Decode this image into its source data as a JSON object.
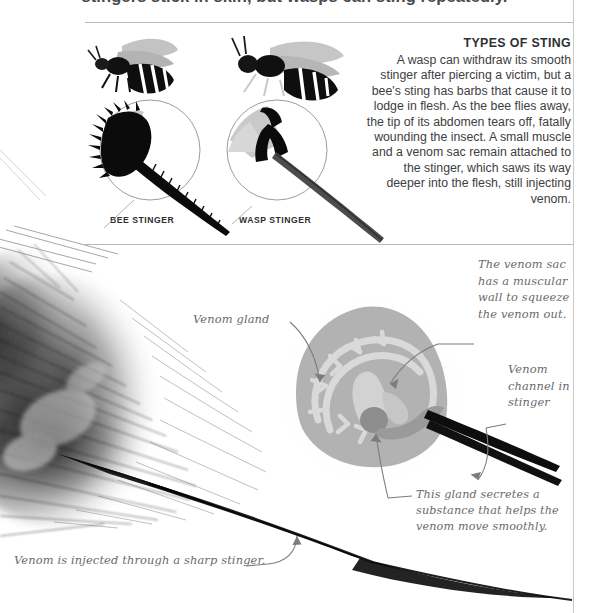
{
  "page": {
    "headline_clipped": "stingers stick in skin, but wasps can sting repeatedly.",
    "background": "#ffffff",
    "rule_color": "#b9b9ba"
  },
  "types_of_sting": {
    "title": "TYPES OF STING",
    "body": "A wasp can withdraw its smooth stinger after piercing a victim, but a bee's sting has barbs that cause it to lodge in flesh. As the bee flies away, the tip of its abdomen tears off, fatally wounding the insect. A small muscle and a venom sac remain attached to the stinger, which saws its way deeper into the flesh, still injecting venom."
  },
  "comparison": {
    "bee": {
      "caption": "BEE STINGER",
      "insect_icon": "honeybee-icon",
      "detail_icon": "barbed-stinger-icon"
    },
    "wasp": {
      "caption": "WASP STINGER",
      "insect_icon": "wasp-icon",
      "detail_icon": "smooth-stinger-icon"
    }
  },
  "anatomy": {
    "venom_gland_label": "Venom gland",
    "venom_sac_note": "The venom sac\nhas a muscular\nwall to squeeze\nthe venom out.",
    "venom_channel_label": "Venom\nchannel in\nstinger",
    "gland_secretion_note": "This gland secretes a\nsubstance that helps the\nvenom move smoothly.",
    "bottom_caption": "Venom is injected through a sharp stinger.",
    "sac_color": "#b2b2b2",
    "duct_color": "#d5d5d5",
    "gland_color": "#9a9a9a",
    "leader_color": "#7c7c7e"
  }
}
